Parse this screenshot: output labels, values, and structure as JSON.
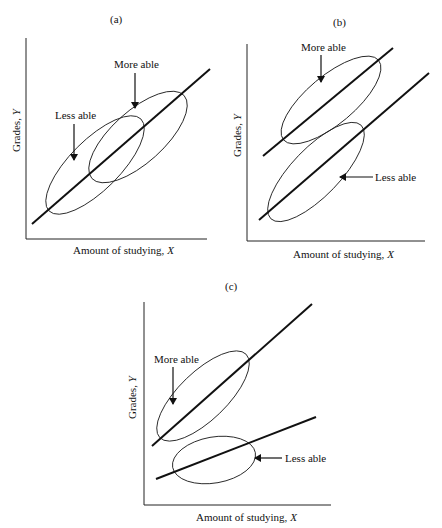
{
  "figure": {
    "panels": [
      {
        "id": "a",
        "label": "(a)",
        "x_axis_label": "Amount of studying, X",
        "y_axis_label": "Grades, Y",
        "annotations": [
          "More able",
          "Less able"
        ]
      },
      {
        "id": "b",
        "label": "(b)",
        "x_axis_label": "Amount of studying, X",
        "y_axis_label": "Grades, Y",
        "annotations": [
          "More able",
          "Less able"
        ]
      },
      {
        "id": "c",
        "label": "(c)",
        "x_axis_label": "Amount of studying, X",
        "y_axis_label": "Grades, Y",
        "annotations": [
          "More able",
          "Less able"
        ]
      }
    ]
  },
  "chart_data": [
    {
      "type": "line",
      "title": "(a)",
      "xlabel": "Amount of studying, X",
      "ylabel": "Grades, Y",
      "description": "Single common regression line; 'Less able' ellipse at lower-left and 'More able' ellipse at upper-right, overlapping along the same line",
      "series": [
        {
          "name": "Common regression line",
          "slope": "same",
          "intercept": "same"
        }
      ],
      "groups": [
        "Less able",
        "More able"
      ]
    },
    {
      "type": "line",
      "title": "(b)",
      "xlabel": "Amount of studying, X",
      "ylabel": "Grades, Y",
      "description": "Two parallel regression lines with equal slopes; 'More able' line has a higher intercept than 'Less able' line",
      "series": [
        {
          "name": "More able",
          "slope": "equal",
          "intercept": "higher"
        },
        {
          "name": "Less able",
          "slope": "equal",
          "intercept": "lower"
        }
      ]
    },
    {
      "type": "line",
      "title": "(c)",
      "xlabel": "Amount of studying, X",
      "ylabel": "Grades, Y",
      "description": "Two non-parallel regression lines; 'More able' line is steeper than 'Less able' line (interaction)",
      "series": [
        {
          "name": "More able",
          "slope": "steeper",
          "intercept": "higher"
        },
        {
          "name": "Less able",
          "slope": "shallower",
          "intercept": "lower"
        }
      ]
    }
  ]
}
